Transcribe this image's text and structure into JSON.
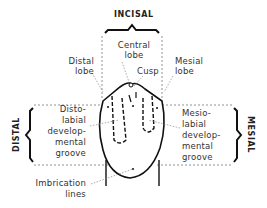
{
  "diagram": {
    "type": "dental-anatomy",
    "directions": {
      "top": "INCISAL",
      "left": "DISTAL",
      "right": "MESIAL"
    },
    "labels": {
      "central_lobe": [
        "Central",
        "lobe"
      ],
      "cusp": "Cusp",
      "distal_lobe": [
        "Distal",
        "lobe"
      ],
      "mesial_lobe": [
        "Mesial",
        "lobe"
      ],
      "distolabial_groove": [
        "Disto-",
        "labial",
        "develop-",
        "mental",
        "groove"
      ],
      "mesiolabial_groove": [
        "Mesio-",
        "labial",
        "develop-",
        "mental",
        "groove"
      ],
      "imbrication_lines": [
        "Imbrication",
        "lines"
      ]
    },
    "colors": {
      "line": "#1a1a1a",
      "text": "#333333",
      "leader": "#777777"
    }
  }
}
